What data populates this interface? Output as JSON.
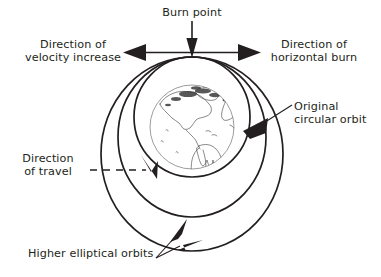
{
  "diagram": {
    "background_color": "#ffffff",
    "line_color": "#231f20",
    "globe_outline_color": "#8f9296",
    "text_color": "#231f20",
    "labels": {
      "burn_point": "Burn point",
      "velocity_increase": "Direction of\nvelocity increase",
      "horizontal_burn": "Direction of\nhorizontal burn",
      "original_orbit": "Original\ncircular orbit",
      "direction_of_travel": "Direction\nof travel",
      "higher_orbits": "Higher elliptical orbits"
    },
    "elements": {
      "globe_name": "earth-globe",
      "burn_point_marker": "burn-point",
      "orbit_inner": "original-circular-orbit",
      "orbit_middle": "higher-elliptical-orbit-1",
      "orbit_outer": "higher-elliptical-orbit-2"
    },
    "geometry": {
      "earth_center_x": 192,
      "earth_center_y": 127,
      "earth_radius": 42,
      "burn_point_x": 192,
      "burn_point_y": 57,
      "orbit_inner_rx": 58,
      "orbit_inner_ry": 60,
      "orbit_middle_rx": 74,
      "orbit_middle_ry": 80,
      "orbit_outer_rx": 91,
      "orbit_outer_ry": 97
    }
  }
}
